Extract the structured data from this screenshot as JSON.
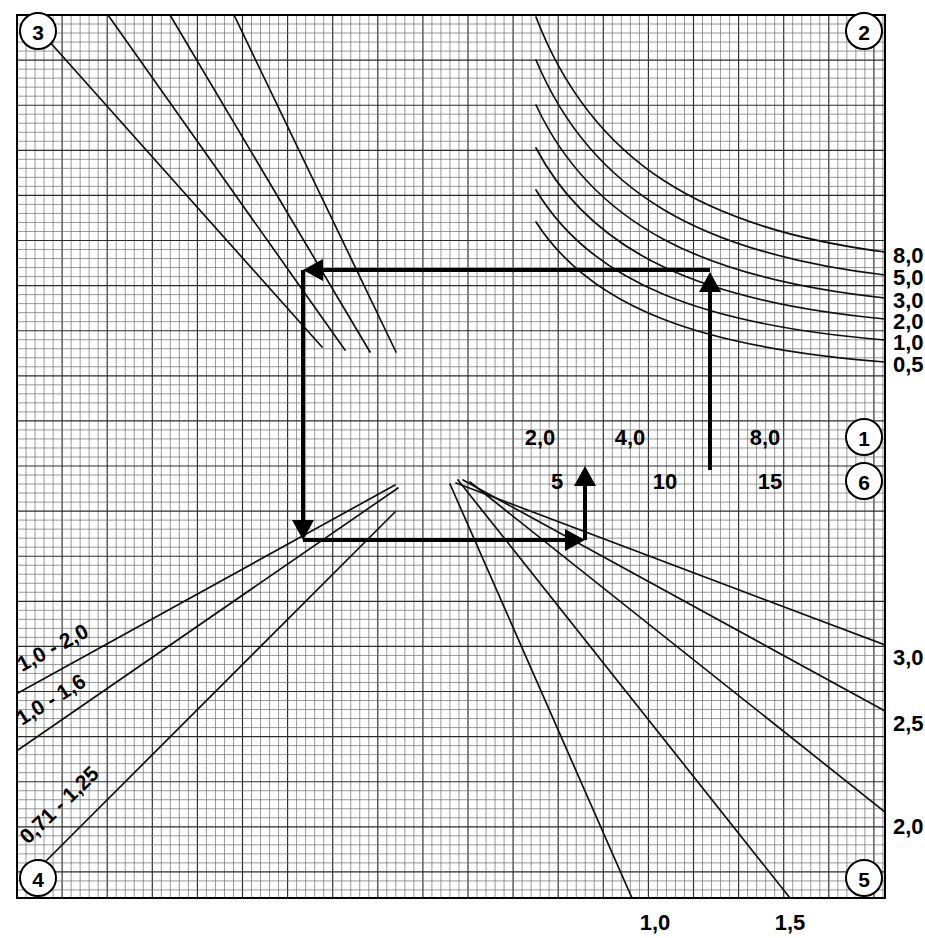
{
  "chart_data": {
    "type": "line",
    "title": "",
    "subtitle": "",
    "xlabel": "",
    "ylabel": "",
    "grid": true,
    "legend_position": "none",
    "plot_area": {
      "x": 17,
      "y": 15,
      "width": 868,
      "height": 883
    },
    "grid_spec": {
      "minor_step_px": 9.02,
      "major_every": 5
    },
    "quadrant_badges": [
      {
        "id": "badge-3",
        "label": "3",
        "cx": 38,
        "cy": 31,
        "r": 18
      },
      {
        "id": "badge-2",
        "label": "2",
        "cx": 864,
        "cy": 31,
        "r": 18
      },
      {
        "id": "badge-1",
        "label": "1",
        "cx": 864,
        "cy": 437,
        "r": 18
      },
      {
        "id": "badge-6",
        "label": "6",
        "cx": 864,
        "cy": 481,
        "r": 18
      },
      {
        "id": "badge-4",
        "label": "4",
        "cx": 38,
        "cy": 878,
        "r": 18
      },
      {
        "id": "badge-5",
        "label": "5",
        "cx": 864,
        "cy": 878,
        "r": 18
      }
    ],
    "axes": [
      {
        "name": "axis-1-top-horizontal",
        "badge": "1",
        "orientation": "horizontal",
        "y": 437,
        "ticks": [
          {
            "label": "2,0",
            "x": 540
          },
          {
            "label": "4,0",
            "x": 630
          },
          {
            "label": "8,0",
            "x": 765
          }
        ]
      },
      {
        "name": "axis-6-lower-horizontal",
        "badge": "6",
        "orientation": "horizontal",
        "y": 481,
        "ticks": [
          {
            "label": "5",
            "x": 557
          },
          {
            "label": "10",
            "x": 665
          },
          {
            "label": "15",
            "x": 770
          }
        ]
      },
      {
        "name": "axis-2-right-vertical",
        "badge": "2",
        "orientation": "vertical",
        "x": 893,
        "ticks": [
          {
            "label": "8,0",
            "y": 255
          },
          {
            "label": "5,0",
            "y": 277
          },
          {
            "label": "3,0",
            "y": 300
          },
          {
            "label": "2,0",
            "y": 321
          },
          {
            "label": "1,0",
            "y": 342
          },
          {
            "label": "0,5",
            "y": 364
          }
        ]
      },
      {
        "name": "axis-5-right-vertical",
        "badge": "5",
        "orientation": "vertical",
        "x": 893,
        "ticks": [
          {
            "label": "3,0",
            "y": 657
          },
          {
            "label": "2,5",
            "y": 723
          },
          {
            "label": "2,0",
            "y": 826
          }
        ]
      },
      {
        "name": "axis-bottom-horizontal",
        "badge": "5",
        "orientation": "horizontal",
        "y": 922,
        "ticks": [
          {
            "label": "1,0",
            "x": 655
          },
          {
            "label": "1,5",
            "x": 790
          }
        ]
      }
    ],
    "curve_families": [
      {
        "name": "quadrant-3-parallel-lines",
        "quadrant": "3",
        "style": "straight descending",
        "count": 4,
        "lines": [
          {
            "x1": 48,
            "y1": 40,
            "x2": 322,
            "y2": 347
          },
          {
            "x1": 108,
            "y1": 15,
            "x2": 345,
            "y2": 350
          },
          {
            "x1": 170,
            "y1": 15,
            "x2": 370,
            "y2": 352
          },
          {
            "x1": 234,
            "y1": 15,
            "x2": 396,
            "y2": 352
          }
        ]
      },
      {
        "name": "quadrant-2-hyperbolic-curves",
        "quadrant": "2",
        "style": "curved descending",
        "count": 6,
        "labels": [
          "8,0",
          "5,0",
          "3,0",
          "2,0",
          "1,0",
          "0,5"
        ],
        "curves": [
          {
            "start_x": 536,
            "start_y": 17,
            "end_x": 885,
            "end_y": 252
          },
          {
            "start_x": 536,
            "start_y": 60,
            "end_x": 885,
            "end_y": 275
          },
          {
            "start_x": 536,
            "start_y": 105,
            "end_x": 885,
            "end_y": 298
          },
          {
            "start_x": 536,
            "start_y": 148,
            "end_x": 885,
            "end_y": 319
          },
          {
            "start_x": 536,
            "start_y": 190,
            "end_x": 885,
            "end_y": 340
          },
          {
            "start_x": 536,
            "start_y": 222,
            "end_x": 885,
            "end_y": 362
          }
        ]
      },
      {
        "name": "quadrant-4-ratio-lines",
        "quadrant": "4",
        "style": "straight ascending",
        "count": 3,
        "lines": [
          {
            "label": "1,0 - 2,0",
            "x1": 18,
            "y1": 693,
            "x2": 395,
            "y2": 485,
            "label_x": 22,
            "label_y": 672,
            "rotate": -28
          },
          {
            "label": "1,0 - 1,6",
            "x1": 18,
            "y1": 750,
            "x2": 398,
            "y2": 488,
            "label_x": 22,
            "label_y": 726,
            "rotate": -32
          },
          {
            "label": "0,71 - 1,25",
            "x1": 45,
            "y1": 862,
            "x2": 395,
            "y2": 512,
            "label_x": 28,
            "label_y": 845,
            "rotate": -44
          }
        ]
      },
      {
        "name": "quadrant-5-fan-lines",
        "quadrant": "5",
        "style": "straight descending fan",
        "count": 5,
        "lines": [
          {
            "x1": 456,
            "y1": 483,
            "x2": 885,
            "y2": 645
          },
          {
            "x1": 463,
            "y1": 480,
            "x2": 885,
            "y2": 711
          },
          {
            "x1": 470,
            "y1": 482,
            "x2": 885,
            "y2": 812
          },
          {
            "x1": 458,
            "y1": 480,
            "x2": 790,
            "y2": 898
          },
          {
            "x1": 450,
            "y1": 484,
            "x2": 632,
            "y2": 898
          }
        ]
      }
    ],
    "construction_path": {
      "name": "worked-example-path",
      "description": "Stepped arrow route through the four quadrants",
      "stroke_color": "#000000",
      "segments": [
        {
          "name": "segment-up-start",
          "from": [
            585,
            540
          ],
          "to": [
            585,
            466
          ],
          "arrow_at": "to",
          "direction": "up"
        },
        {
          "name": "segment-right-to-left-lower",
          "from": [
            303,
            540
          ],
          "to": [
            585,
            540
          ],
          "arrow_at": "to",
          "direction": "right"
        },
        {
          "name": "segment-down-left",
          "from": [
            303,
            270
          ],
          "to": [
            303,
            540
          ],
          "arrow_at": "to",
          "direction": "down"
        },
        {
          "name": "segment-left-upper",
          "from": [
            710,
            270
          ],
          "to": [
            303,
            270
          ],
          "arrow_at": "to",
          "direction": "left"
        },
        {
          "name": "segment-up-right",
          "from": [
            710,
            470
          ],
          "to": [
            710,
            272
          ],
          "arrow_at": "to",
          "direction": "up"
        }
      ]
    }
  }
}
